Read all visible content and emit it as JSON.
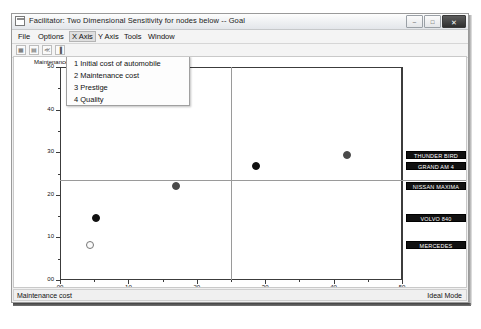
{
  "window": {
    "title": "Facilitator: Two Dimensional  Sensitivity for nodes below -- Goal",
    "app_icon": "window-document-icon",
    "minimize_glyph": "–",
    "maximize_glyph": "□",
    "close_glyph": "✕"
  },
  "menubar": {
    "items": [
      {
        "label": "File",
        "selected": false
      },
      {
        "label": "Options",
        "selected": false
      },
      {
        "label": "X Axis",
        "selected": true
      },
      {
        "label": "Y Axis",
        "selected": false
      },
      {
        "label": "Tools",
        "selected": false
      },
      {
        "label": "Window",
        "selected": false
      }
    ]
  },
  "toolbar": {
    "buttons": [
      {
        "name": "grid-button",
        "glyph": "▦"
      },
      {
        "name": "table-button",
        "glyph": "▤"
      },
      {
        "name": "back-button",
        "glyph": "≪"
      },
      {
        "name": "bars-button",
        "glyph": "▐"
      }
    ]
  },
  "dropdown": {
    "open_for": "X Axis",
    "items": [
      {
        "label": "1 Initial cost of automobile"
      },
      {
        "label": "2 Maintenance cost"
      },
      {
        "label": "3 Prestige"
      },
      {
        "label": "4 Quality"
      }
    ]
  },
  "chart_data": {
    "type": "scatter",
    "title": "",
    "xlabel": "Initial cost of automobile",
    "ylabel": "Maintenance cost",
    "xlim": [
      0,
      50
    ],
    "ylim": [
      0,
      50
    ],
    "xticks": [
      "00",
      "10",
      "20",
      "30",
      "40",
      "50"
    ],
    "xtick_values": [
      0,
      10,
      20,
      30,
      40,
      50
    ],
    "yticks": [
      "00",
      "10",
      "20",
      "30",
      "40",
      "50"
    ],
    "ytick_values": [
      0,
      10,
      20,
      30,
      40,
      50
    ],
    "grid": false,
    "crosshair_x": 25.0,
    "crosshair_y": 23.5,
    "legend": "right-labels",
    "points": [
      {
        "label": "THUNDER BIRD",
        "x": 42.0,
        "y": 29.3,
        "fill": "#4a4a4a",
        "style": "filled-gray"
      },
      {
        "label": "GRAND AM 4",
        "x": 28.6,
        "y": 26.8,
        "fill": "#111111",
        "style": "filled-black"
      },
      {
        "label": "NISSAN MAXIMA",
        "x": 16.9,
        "y": 22.0,
        "fill": "#4a4a4a",
        "style": "filled-gray"
      },
      {
        "label": "VOLVO 840",
        "x": 5.3,
        "y": 14.6,
        "fill": "#111111",
        "style": "filled-black"
      },
      {
        "label": "MERCEDES",
        "x": 4.4,
        "y": 8.3,
        "fill": "#fbfbfb",
        "style": "open"
      }
    ],
    "right_labels": [
      {
        "text": "THUNDER BIRD",
        "y": 29.3
      },
      {
        "text": "GRAND AM 4",
        "y": 26.8
      },
      {
        "text": "NISSAN MAXIMA",
        "y": 22.0
      },
      {
        "text": "VOLVO 840",
        "y": 14.6
      },
      {
        "text": "MERCEDES",
        "y": 8.3
      }
    ]
  },
  "statusbar": {
    "left_text": "Maintenance cost",
    "right_text": "Ideal Mode"
  }
}
